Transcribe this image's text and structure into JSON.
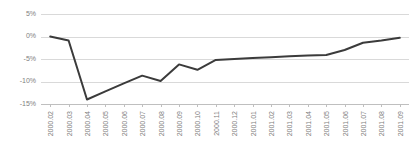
{
  "chart_data": {
    "type": "line",
    "title": "",
    "subtitle": "",
    "xlabel": "",
    "ylabel": "",
    "grid": true,
    "legend": false,
    "legend_position": "none",
    "line_color": "#3b3b3b",
    "grid_color": "#d9d9d9",
    "axis_color": "#bfbfbf",
    "tick_label_color": "#808080",
    "ylim": [
      -15,
      5
    ],
    "yticks": [
      5,
      0,
      -5,
      -10,
      -15
    ],
    "ytick_labels": [
      "5%",
      "0%",
      "-5%",
      "-10%",
      "-15%"
    ],
    "categories": [
      "2000.02",
      "2000.03",
      "2000.04",
      "2000.05",
      "2000.06",
      "2000.07",
      "2000.08",
      "2000.09",
      "2000.10",
      "2000.11",
      "2000.12",
      "2001.01",
      "2001.02",
      "2001.03",
      "2001.04",
      "2001.05",
      "2001.06",
      "2001.07",
      "2001.08",
      "2001.09"
    ],
    "values": [
      0.0,
      -0.9,
      -14.0,
      -12.2,
      -10.4,
      -8.7,
      -9.9,
      -6.2,
      -7.4,
      -5.2,
      -5.0,
      -4.8,
      -4.6,
      -4.4,
      -4.2,
      -4.1,
      -3.0,
      -1.4,
      -0.9,
      -0.3
    ]
  }
}
